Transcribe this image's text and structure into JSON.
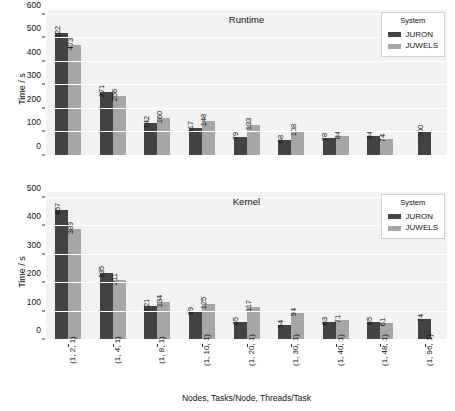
{
  "figure": {
    "legend_title": "System",
    "series_names": [
      "JURON",
      "JUWELS"
    ],
    "colors": {
      "juron": "#434343",
      "juwels": "#a6a6a6",
      "plot_background": "#f2f2f2",
      "grid": "#ffffff"
    },
    "xlabel": "Nodes, Tasks/Node, Threads/Task"
  },
  "chart_data": [
    {
      "type": "bar",
      "title": "Runtime",
      "xlabel": "Nodes, Tasks/Node, Threads/Task",
      "ylabel": "Time / s",
      "categories": [
        "(1, 2, 1)",
        "(1, 4, 1)",
        "(1, 8, 1)",
        "(1, 10, 1)",
        "(1, 20, 1)",
        "(1, 30, 1)",
        "(1, 40, 1)",
        "(1, 48, 1)",
        "(1, 96, 1)"
      ],
      "series": [
        {
          "name": "JURON",
          "values": [
            522,
            271,
            142,
            117,
            79,
            68,
            78,
            84,
            100
          ]
        },
        {
          "name": "JUWELS",
          "values": [
            473,
            256,
            160,
            148,
            133,
            108,
            84,
            74,
            null
          ]
        }
      ],
      "ylim": [
        0,
        620
      ],
      "yticks": [
        0,
        100,
        200,
        300,
        400,
        500,
        600
      ],
      "ytick_labels": [
        "0",
        "100",
        "200",
        "300",
        "400",
        "500",
        "600"
      ],
      "grid": true,
      "legend_position": "top-right"
    },
    {
      "type": "bar",
      "title": "Kernel",
      "xlabel": "Nodes, Tasks/Node, Threads/Task",
      "ylabel": "Time / s",
      "categories": [
        "(1, 2, 1)",
        "(1, 4, 1)",
        "(1, 8, 1)",
        "(1, 10, 1)",
        "(1, 20, 1)",
        "(1, 30, 1)",
        "(1, 40, 1)",
        "(1, 48, 1)",
        "(1, 96, 1)"
      ],
      "series": [
        {
          "name": "JURON",
          "values": [
            457,
            235,
            121,
            99,
            65,
            54,
            63,
            65,
            74
          ]
        },
        {
          "name": "JUWELS",
          "values": [
            389,
            211,
            134,
            125,
            117,
            94,
            71,
            61,
            null
          ]
        }
      ],
      "ylim": [
        0,
        520
      ],
      "yticks": [
        0,
        100,
        200,
        300,
        400,
        500
      ],
      "ytick_labels": [
        "0",
        "100",
        "200",
        "300",
        "400",
        "500"
      ],
      "grid": true,
      "legend_position": "top-right"
    }
  ]
}
